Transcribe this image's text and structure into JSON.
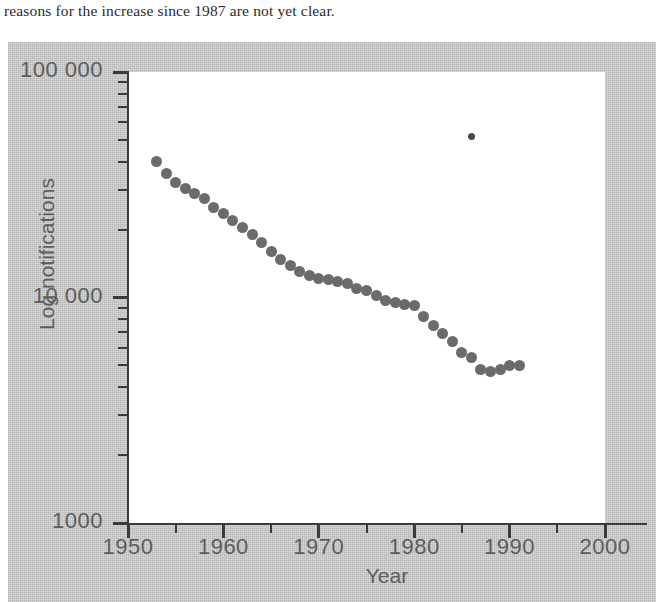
{
  "page": {
    "caption_text": "reasons for the increase since 1987 are not yet clear."
  },
  "figure": {
    "panel_color": "#c3c3c3",
    "plot_background": "#ffffff",
    "marker_color": "#6b6b6b",
    "outlier_color": "#4a4a4a",
    "axis_color": "#3a3a3a",
    "label_color": "#5d5d5d"
  },
  "chart_data": {
    "type": "scatter",
    "title": "",
    "xlabel": "Year",
    "ylabel": "Log notifications",
    "xlim": [
      1950,
      2000
    ],
    "ylim": [
      1000,
      100000
    ],
    "yscale": "log",
    "grid": false,
    "legend": null,
    "xticks": [
      1950,
      1960,
      1970,
      1980,
      1990,
      2000
    ],
    "xtick_labels": [
      "1950",
      "1960",
      "1970",
      "1980",
      "1990",
      "2000"
    ],
    "xminor_ticks": [
      1955,
      1965,
      1975,
      1985,
      1995
    ],
    "yticks": [
      1000,
      10000,
      100000
    ],
    "ytick_labels": [
      "1000",
      "10 000",
      "100 000"
    ],
    "yminor_ticks": [
      2000,
      3000,
      4000,
      5000,
      6000,
      7000,
      8000,
      9000,
      20000,
      30000,
      40000,
      50000,
      60000,
      70000,
      80000,
      90000
    ],
    "series": [
      {
        "name": "Notifications",
        "marker": "circle",
        "x": [
          1953,
          1954,
          1955,
          1956,
          1957,
          1958,
          1959,
          1960,
          1961,
          1962,
          1963,
          1964,
          1965,
          1966,
          1967,
          1968,
          1969,
          1970,
          1971,
          1972,
          1973,
          1974,
          1975,
          1976,
          1977,
          1978,
          1979,
          1980,
          1981,
          1982,
          1983,
          1984,
          1985,
          1986,
          1987,
          1988,
          1989,
          1990,
          1991
        ],
        "values": [
          40000,
          35500,
          32500,
          30500,
          29000,
          27500,
          25000,
          23500,
          22000,
          20500,
          19000,
          17500,
          16000,
          14800,
          13800,
          13000,
          12500,
          12200,
          12000,
          11800,
          11500,
          11000,
          10700,
          10200,
          9700,
          9500,
          9300,
          9200,
          8200,
          7500,
          6900,
          6400,
          5700,
          5400,
          4800,
          4700,
          4800,
          5000,
          5000
        ]
      },
      {
        "name": "Outlier",
        "marker": "small-circle",
        "x": [
          1986
        ],
        "values": [
          52000
        ]
      }
    ]
  }
}
